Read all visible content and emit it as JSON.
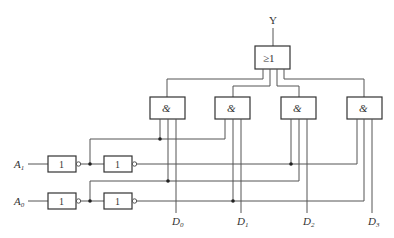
{
  "diagram": {
    "title_strip": "",
    "output_label": "Y",
    "or_gate": {
      "symbol": "≥1"
    },
    "and_gates": [
      {
        "id": "and-0",
        "symbol": "&"
      },
      {
        "id": "and-1",
        "symbol": "&"
      },
      {
        "id": "and-2",
        "symbol": "&"
      },
      {
        "id": "and-3",
        "symbol": "&"
      }
    ],
    "inputs": [
      {
        "name": "A",
        "sub": "1"
      },
      {
        "name": "A",
        "sub": "0"
      }
    ],
    "not_gates": [
      {
        "symbol": "1"
      },
      {
        "symbol": "1"
      },
      {
        "symbol": "1"
      },
      {
        "symbol": "1"
      }
    ],
    "data_inputs": [
      {
        "name": "D",
        "sub": "0"
      },
      {
        "name": "D",
        "sub": "1"
      },
      {
        "name": "D",
        "sub": "2"
      },
      {
        "name": "D",
        "sub": "3"
      }
    ],
    "colors": {
      "line": "#555555",
      "text": "#333333",
      "background": "#ffffff"
    }
  }
}
